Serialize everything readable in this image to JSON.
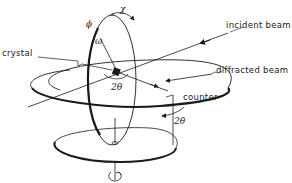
{
  "diagram": {
    "labels": {
      "crystal": "crystal",
      "incident_beam": "incident beam",
      "diffracted_beam": "diffracted beam",
      "counter": "counter",
      "chi": "χ",
      "phi": "ϕ",
      "omega": "ω",
      "two_theta_center": "2θ",
      "two_theta_counter": "2θ"
    },
    "colors": {
      "stroke": "#1a1a1a",
      "background": "#ffffff"
    }
  }
}
